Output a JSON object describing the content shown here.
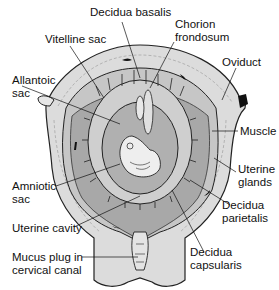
{
  "figure": {
    "labels": {
      "decidua_basalis": "Decidua basalis",
      "chorion_frondosum_1": "Chorion",
      "chorion_frondosum_2": "frondosum",
      "vitelline_sac": "Vitelline sac",
      "oviduct": "Oviduct",
      "allantoic_sac_1": "Allantoic",
      "allantoic_sac_2": "sac",
      "muscle": "Muscle",
      "uterine_glands_1": "Uterine",
      "uterine_glands_2": "glands",
      "amniotic_sac_1": "Amniotic",
      "amniotic_sac_2": "sac",
      "decidua_parietalis_1": "Decidua",
      "decidua_parietalis_2": "parietalis",
      "uterine_cavity": "Uterine cavity",
      "decidua_capsularis_1": "Decidua",
      "decidua_capsularis_2": "capsularis",
      "mucus_plug_1": "Mucus plug in",
      "mucus_plug_2": "cervical canal"
    },
    "colors": {
      "muscle_wall": "#d9d9d9",
      "decidua": "#bdbdbd",
      "cavity": "#9e9e9e",
      "outline": "#222222",
      "background": "#ffffff"
    }
  }
}
